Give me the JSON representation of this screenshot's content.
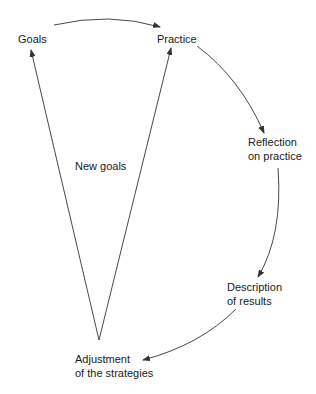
{
  "diagram": {
    "type": "cycle",
    "nodes": {
      "goals": {
        "label": "Goals"
      },
      "practice": {
        "label": "Practice"
      },
      "reflection": {
        "line1": "Reflection",
        "line2": "on practice"
      },
      "description": {
        "line1": "Description",
        "line2": "of results"
      },
      "adjustment": {
        "line1": "Adjustment",
        "line2": "of the strategies"
      },
      "new_goals": {
        "label": "New goals"
      }
    },
    "edges": [
      {
        "from": "Goals",
        "to": "Practice"
      },
      {
        "from": "Practice",
        "to": "Reflection on practice"
      },
      {
        "from": "Reflection on practice",
        "to": "Description of results"
      },
      {
        "from": "Description of results",
        "to": "Adjustment of the strategies"
      },
      {
        "from": "Adjustment of the strategies",
        "to": "Goals"
      },
      {
        "from": "Adjustment of the strategies",
        "to": "Practice"
      }
    ],
    "line_color": "#333333"
  }
}
